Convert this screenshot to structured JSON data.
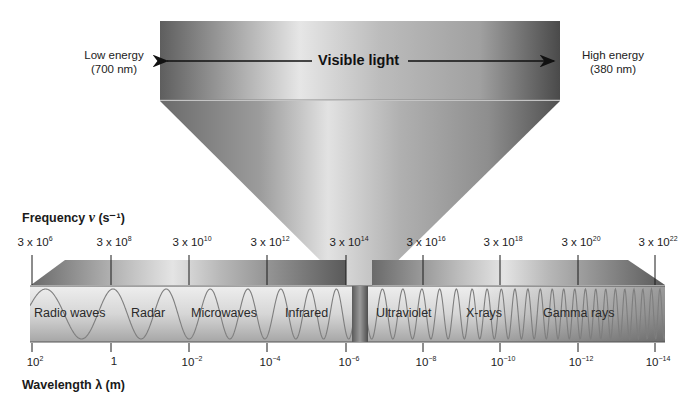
{
  "visible_light": {
    "title": "Visible light",
    "low_energy_label": "Low energy",
    "low_energy_value": "(700 nm)",
    "high_energy_label": "High energy",
    "high_energy_value": "(380 nm)"
  },
  "frequency_axis": {
    "title_prefix": "Frequency ",
    "title_symbol": "ν",
    "title_unit": " (s⁻¹)",
    "ticks": [
      {
        "base": "3 x 10",
        "exp": "6"
      },
      {
        "base": "3 x 10",
        "exp": "8"
      },
      {
        "base": "3 x 10",
        "exp": "10"
      },
      {
        "base": "3 x 10",
        "exp": "12"
      },
      {
        "base": "3 x 10",
        "exp": "14"
      },
      {
        "base": "3 x 10",
        "exp": "16"
      },
      {
        "base": "3 x 10",
        "exp": "18"
      },
      {
        "base": "3 x 10",
        "exp": "20"
      },
      {
        "base": "3 x 10",
        "exp": "22"
      }
    ]
  },
  "wavelength_axis": {
    "title": "Wavelength λ (m)",
    "ticks": [
      {
        "base": "10",
        "exp": "2"
      },
      {
        "base": "1",
        "exp": ""
      },
      {
        "base": "10",
        "exp": "−2"
      },
      {
        "base": "10",
        "exp": "−4"
      },
      {
        "base": "10",
        "exp": "−6"
      },
      {
        "base": "10",
        "exp": "−8"
      },
      {
        "base": "10",
        "exp": "−10"
      },
      {
        "base": "10",
        "exp": "−12"
      },
      {
        "base": "10",
        "exp": "−14"
      }
    ]
  },
  "regions": [
    {
      "label": "Radio waves"
    },
    {
      "label": "Radar"
    },
    {
      "label": "Microwaves"
    },
    {
      "label": "Infrared"
    },
    {
      "label": "Ultraviolet"
    },
    {
      "label": "X-rays"
    },
    {
      "label": "Gamma rays"
    }
  ],
  "colors": {
    "band_light": "#e8e8e8",
    "band_dark": "#8a8a8a",
    "funnel_dark": "#5a5a5a",
    "funnel_light": "#d8d8d8",
    "wave": "#7a7a7a",
    "tick": "#1a1a1a"
  }
}
